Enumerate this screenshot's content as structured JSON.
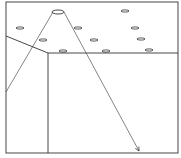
{
  "diagram": {
    "type": "line-drawing",
    "stroke_color": "#333333",
    "background": "#ffffff",
    "frame": {
      "x1": 6,
      "y1": 2,
      "x2": 178,
      "y2": 153
    },
    "boundary_polyline": [
      [
        6,
        36
      ],
      [
        48,
        53
      ],
      [
        178,
        53
      ]
    ],
    "divider_vertical": {
      "x": 48,
      "y1": 53,
      "y2": 153
    },
    "source": {
      "cx": 58,
      "cy": 12,
      "rx": 6,
      "ry": 2
    },
    "beam_left": {
      "x1": 53,
      "y1": 12,
      "x2": 6,
      "y2": 92
    },
    "beam_right": {
      "x1": 64,
      "y1": 12,
      "x2": 139,
      "y2": 151
    },
    "objects": [
      {
        "cx": 125,
        "cy": 11
      },
      {
        "cx": 20,
        "cy": 28
      },
      {
        "cx": 78,
        "cy": 28
      },
      {
        "cx": 135,
        "cy": 28
      },
      {
        "cx": 43,
        "cy": 40
      },
      {
        "cx": 94,
        "cy": 40
      },
      {
        "cx": 141,
        "cy": 39
      },
      {
        "cx": 63,
        "cy": 51
      },
      {
        "cx": 106,
        "cy": 51
      },
      {
        "cx": 149,
        "cy": 50
      }
    ]
  }
}
